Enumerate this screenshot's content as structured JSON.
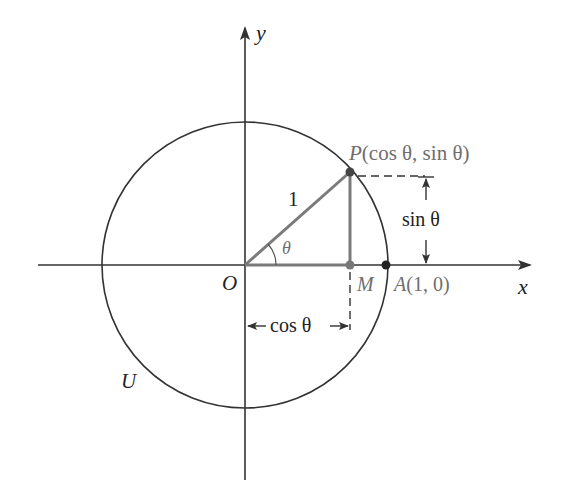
{
  "diagram": {
    "colors": {
      "axis": "#333333",
      "circle": "#333333",
      "triangle": "#7a7a7a",
      "label_dark": "#222222",
      "label_gray": "#6e6e6e"
    },
    "axes": {
      "x_label": "x",
      "y_label": "y"
    },
    "circle": {
      "label": "U",
      "radius_value": "1"
    },
    "points": {
      "origin": "O",
      "p": {
        "name": "P",
        "coords": "(cos θ, sin θ)"
      },
      "m": "M",
      "a": {
        "name": "A",
        "coords": "(1, 0)"
      }
    },
    "angle_label": "θ",
    "dimensions": {
      "sin_label": "sin θ",
      "cos_label": "cos θ"
    }
  }
}
